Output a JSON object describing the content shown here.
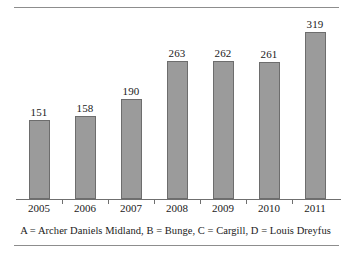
{
  "figure": {
    "caption": "A = Archer Daniels Midland, B = Bunge, C = Cargill, D = Louis Dreyfus",
    "bar_fill_color": "#9b9b9b",
    "bar_border_color": "#6d6d6d",
    "axis_color": "#6f6f6f",
    "rule_color": "#8d8d8d"
  },
  "chart_data": {
    "type": "bar",
    "title": "",
    "subtitle": "",
    "xlabel": "",
    "ylabel": "",
    "categories": [
      "2005",
      "2006",
      "2007",
      "2008",
      "2009",
      "2010",
      "2011"
    ],
    "values": [
      151,
      158,
      190,
      263,
      262,
      261,
      319
    ],
    "data_labels": [
      "151",
      "158",
      "190",
      "263",
      "262",
      "261",
      "319"
    ],
    "ylim": [
      0,
      360
    ],
    "grid": false,
    "legend": null,
    "annotations": [
      "A = Archer Daniels Midland, B = Bunge, C = Cargill, D = Louis Dreyfus"
    ]
  }
}
